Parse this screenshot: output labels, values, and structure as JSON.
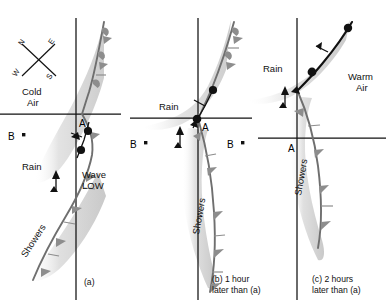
{
  "figure": {
    "type": "weather-front-diagram",
    "colors": {
      "ink": "#111111",
      "front_gray": "#8d8d8d",
      "rain_shade": "#d9d9d9",
      "shower_shade": "#cfcfcf",
      "background": "#ffffff"
    }
  },
  "compass": {
    "name": "compass-rose",
    "orientation_note": "rotated X-cross",
    "n": "N",
    "e": "E",
    "w": "W",
    "s": "S"
  },
  "panels": [
    {
      "id": "a",
      "caption": "(a)",
      "labels": {
        "cold_air_line1": "Cold",
        "cold_air_line2": "Air",
        "point_a": "A",
        "point_b": "B",
        "rain": "Rain",
        "showers": "Showers",
        "wave_line1": "Wave",
        "wave_line2": "LOW"
      }
    },
    {
      "id": "b",
      "caption_line1": "(b) 1 hour",
      "caption_line2": "later than (a)",
      "labels": {
        "point_a": "A",
        "point_b": "B",
        "rain": "Rain",
        "showers": "Showers"
      }
    },
    {
      "id": "c",
      "caption_line1": "(c) 2 hours",
      "caption_line2": "later than (a)",
      "labels": {
        "point_a": "A",
        "point_b": "B",
        "rain": "Rain",
        "showers": "Showers",
        "warm_air_line1": "Warm",
        "warm_air_line2": "Air"
      }
    }
  ]
}
